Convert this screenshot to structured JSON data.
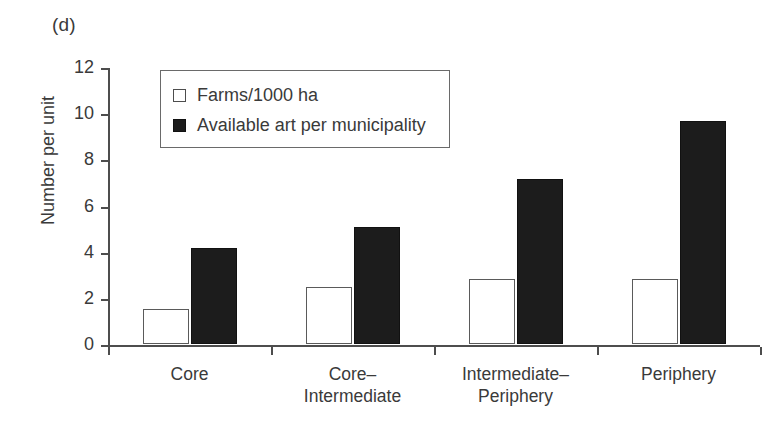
{
  "figure": {
    "panel_label": "(d)"
  },
  "chart_data": {
    "type": "bar",
    "title": "",
    "subtitle": "",
    "xlabel": "",
    "ylabel": "Number per unit",
    "ylim": [
      0,
      12
    ],
    "yticks": [
      0,
      2,
      4,
      6,
      8,
      10,
      12
    ],
    "ytick_labels": [
      "0",
      "2",
      "4",
      "6",
      "8",
      "10",
      "12"
    ],
    "grid": false,
    "legend_position": "upper-left-inside",
    "categories": [
      "Core",
      "Core–\nIntermediate",
      "Intermediate–\nPeriphery",
      "Periphery"
    ],
    "series": [
      {
        "name": "Farms/1000 ha",
        "style": "open",
        "color": "#ffffff",
        "edge_color": "#5a5a5a",
        "values": [
          1.5,
          2.45,
          2.8,
          2.8
        ]
      },
      {
        "name": "Available art per municipality",
        "style": "filled",
        "color": "#1c1c1c",
        "edge_color": "#111111",
        "values": [
          4.15,
          5.05,
          7.15,
          9.65
        ]
      }
    ]
  },
  "legend": {
    "entries": [
      {
        "label": "Farms/1000 ha",
        "swatch": "open-square-icon"
      },
      {
        "label": "Available art per municipality",
        "swatch": "filled-square-icon"
      }
    ]
  }
}
